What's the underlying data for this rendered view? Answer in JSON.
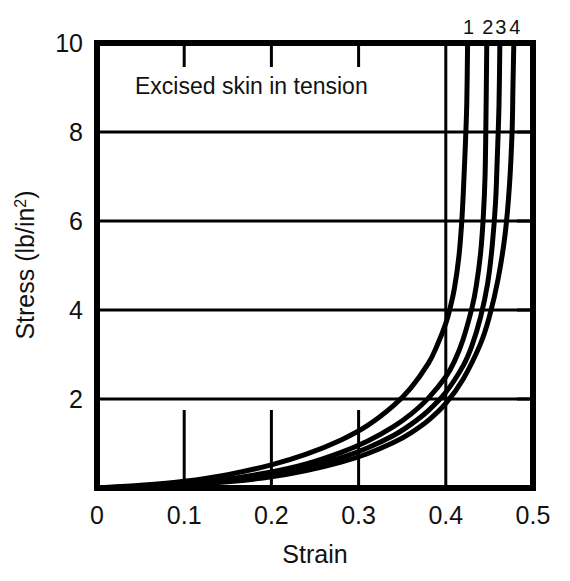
{
  "chart_data": {
    "type": "line",
    "title": "",
    "annotation": "Excised skin in tension",
    "xlabel": "Strain",
    "ylabel": "Stress (lb/in²)",
    "ylabel_main": "Stress (lb/in",
    "ylabel_sup": "2",
    "ylabel_close": ")",
    "xlim": [
      0,
      0.5
    ],
    "ylim": [
      0,
      10
    ],
    "xticks": [
      0,
      0.1,
      0.2,
      0.3,
      0.4,
      0.5
    ],
    "xtick_labels": [
      "0",
      "0.1",
      "0.2",
      "0.3",
      "0.4",
      "0.5"
    ],
    "yticks": [
      0,
      2,
      4,
      6,
      8,
      10
    ],
    "ytick_labels": [
      "2",
      "4",
      "6",
      "8",
      "10"
    ],
    "grid": "horizontal gridlines at 2,4,6,8; vertical gridline at 0.4; short inner ticks at 0.1,0.2,0.3",
    "legend": "curve numbers 1 2 3 4 printed above top axis",
    "legend_position": "top-right",
    "line_color": "#000000",
    "line_width": 5,
    "series": [
      {
        "name": "1",
        "label": "1",
        "points": [
          [
            0.0,
            0.0
          ],
          [
            0.05,
            0.06
          ],
          [
            0.1,
            0.15
          ],
          [
            0.15,
            0.3
          ],
          [
            0.2,
            0.52
          ],
          [
            0.24,
            0.76
          ],
          [
            0.28,
            1.08
          ],
          [
            0.31,
            1.4
          ],
          [
            0.34,
            1.85
          ],
          [
            0.36,
            2.25
          ],
          [
            0.38,
            2.8
          ],
          [
            0.39,
            3.2
          ],
          [
            0.4,
            3.7
          ],
          [
            0.405,
            4.05
          ],
          [
            0.41,
            4.5
          ],
          [
            0.415,
            5.2
          ],
          [
            0.418,
            5.9
          ],
          [
            0.42,
            6.6
          ],
          [
            0.422,
            7.5
          ],
          [
            0.424,
            8.6
          ],
          [
            0.425,
            10.0
          ]
        ]
      },
      {
        "name": "2",
        "label": "2",
        "points": [
          [
            0.0,
            0.0
          ],
          [
            0.05,
            0.04
          ],
          [
            0.1,
            0.1
          ],
          [
            0.15,
            0.2
          ],
          [
            0.2,
            0.36
          ],
          [
            0.24,
            0.54
          ],
          [
            0.28,
            0.8
          ],
          [
            0.31,
            1.05
          ],
          [
            0.34,
            1.38
          ],
          [
            0.36,
            1.66
          ],
          [
            0.38,
            2.02
          ],
          [
            0.4,
            2.5
          ],
          [
            0.41,
            2.85
          ],
          [
            0.42,
            3.35
          ],
          [
            0.43,
            4.05
          ],
          [
            0.435,
            4.55
          ],
          [
            0.44,
            5.3
          ],
          [
            0.443,
            6.1
          ],
          [
            0.445,
            7.0
          ],
          [
            0.446,
            8.2
          ],
          [
            0.447,
            10.0
          ]
        ]
      },
      {
        "name": "3",
        "label": "3",
        "points": [
          [
            0.0,
            0.0
          ],
          [
            0.05,
            0.03
          ],
          [
            0.1,
            0.08
          ],
          [
            0.15,
            0.17
          ],
          [
            0.2,
            0.3
          ],
          [
            0.24,
            0.46
          ],
          [
            0.28,
            0.68
          ],
          [
            0.31,
            0.9
          ],
          [
            0.34,
            1.18
          ],
          [
            0.36,
            1.43
          ],
          [
            0.38,
            1.74
          ],
          [
            0.4,
            2.15
          ],
          [
            0.42,
            2.75
          ],
          [
            0.43,
            3.2
          ],
          [
            0.44,
            3.85
          ],
          [
            0.448,
            4.6
          ],
          [
            0.453,
            5.4
          ],
          [
            0.457,
            6.4
          ],
          [
            0.459,
            7.4
          ],
          [
            0.461,
            8.6
          ],
          [
            0.462,
            10.0
          ]
        ]
      },
      {
        "name": "4",
        "label": "4",
        "points": [
          [
            0.0,
            0.0
          ],
          [
            0.05,
            0.025
          ],
          [
            0.1,
            0.07
          ],
          [
            0.15,
            0.14
          ],
          [
            0.2,
            0.25
          ],
          [
            0.24,
            0.39
          ],
          [
            0.28,
            0.58
          ],
          [
            0.31,
            0.77
          ],
          [
            0.34,
            1.02
          ],
          [
            0.36,
            1.24
          ],
          [
            0.38,
            1.52
          ],
          [
            0.4,
            1.9
          ],
          [
            0.42,
            2.45
          ],
          [
            0.44,
            3.25
          ],
          [
            0.45,
            3.85
          ],
          [
            0.46,
            4.7
          ],
          [
            0.468,
            5.7
          ],
          [
            0.473,
            6.8
          ],
          [
            0.476,
            8.0
          ],
          [
            0.477,
            9.0
          ],
          [
            0.478,
            10.0
          ]
        ]
      }
    ]
  }
}
